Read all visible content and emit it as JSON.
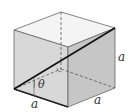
{
  "diagram": {
    "type": "cube-space-diagonal",
    "labels": {
      "edge_bottom_front": "a",
      "edge_bottom_right": "a",
      "edge_vertical_right": "a",
      "angle": "θ"
    },
    "colors": {
      "top_face": "#f4f4f4",
      "front_face": "#d6d6d6",
      "right_face": "#c4c4c4",
      "edge": "#555555",
      "diagonal": "#111111",
      "hidden_edge": "#555555"
    }
  }
}
